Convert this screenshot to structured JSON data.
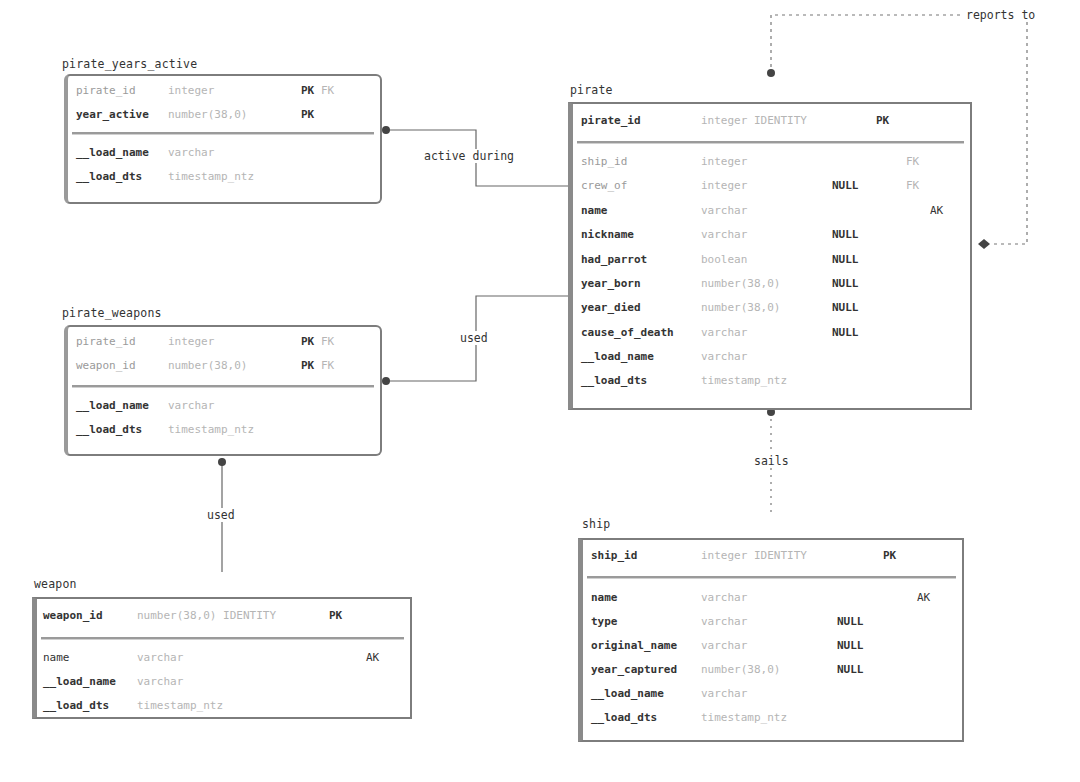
{
  "relationships": {
    "active_during": "active during",
    "used_pirate": "used",
    "used_weapon": "used",
    "reports_to": "reports to",
    "sails": "sails"
  },
  "tables": {
    "pirate_years_active": {
      "title": "pirate_years_active",
      "pk_rows": [
        {
          "name": "pirate_id",
          "type": "integer",
          "nullable": "",
          "k1": "PK",
          "k2": "FK",
          "is_fk": true
        },
        {
          "name": "year_active",
          "type": "number(38,0)",
          "nullable": "",
          "k1": "PK",
          "k2": "",
          "is_fk": false
        }
      ],
      "rows": [
        {
          "name": "__load_name",
          "type": "varchar"
        },
        {
          "name": "__load_dts",
          "type": "timestamp_ntz"
        }
      ]
    },
    "pirate_weapons": {
      "title": "pirate_weapons",
      "pk_rows": [
        {
          "name": "pirate_id",
          "type": "integer",
          "k1": "PK",
          "k2": "FK",
          "is_fk": true
        },
        {
          "name": "weapon_id",
          "type": "number(38,0)",
          "k1": "PK",
          "k2": "FK",
          "is_fk": true
        }
      ],
      "rows": [
        {
          "name": "__load_name",
          "type": "varchar"
        },
        {
          "name": "__load_dts",
          "type": "timestamp_ntz"
        }
      ]
    },
    "weapon": {
      "title": "weapon",
      "pk_rows": [
        {
          "name": "weapon_id",
          "type": "number(38,0) IDENTITY",
          "k1": "PK"
        }
      ],
      "rows": [
        {
          "name": "name",
          "type": "varchar",
          "nullable": "",
          "key": "AK"
        },
        {
          "name": "__load_name",
          "type": "varchar",
          "nullable": "",
          "key": ""
        },
        {
          "name": "__load_dts",
          "type": "timestamp_ntz",
          "nullable": "",
          "key": ""
        }
      ]
    },
    "pirate": {
      "title": "pirate",
      "pk_rows": [
        {
          "name": "pirate_id",
          "type": "integer IDENTITY",
          "k1": "PK"
        }
      ],
      "rows": [
        {
          "name": "ship_id",
          "type": "integer",
          "nullable": "",
          "fk": "FK",
          "ak": "",
          "is_fk": true
        },
        {
          "name": "crew_of",
          "type": "integer",
          "nullable": "NULL",
          "fk": "FK",
          "ak": "",
          "is_fk": true
        },
        {
          "name": "name",
          "type": "varchar",
          "nullable": "",
          "fk": "",
          "ak": "AK",
          "is_fk": false
        },
        {
          "name": "nickname",
          "type": "varchar",
          "nullable": "NULL",
          "fk": "",
          "ak": "",
          "is_fk": false
        },
        {
          "name": "had_parrot",
          "type": "boolean",
          "nullable": "NULL",
          "fk": "",
          "ak": "",
          "is_fk": false
        },
        {
          "name": "year_born",
          "type": "number(38,0)",
          "nullable": "NULL",
          "fk": "",
          "ak": "",
          "is_fk": false
        },
        {
          "name": "year_died",
          "type": "number(38,0)",
          "nullable": "NULL",
          "fk": "",
          "ak": "",
          "is_fk": false
        },
        {
          "name": "cause_of_death",
          "type": "varchar",
          "nullable": "NULL",
          "fk": "",
          "ak": "",
          "is_fk": false
        },
        {
          "name": "__load_name",
          "type": "varchar",
          "nullable": "",
          "fk": "",
          "ak": "",
          "is_fk": false
        },
        {
          "name": "__load_dts",
          "type": "timestamp_ntz",
          "nullable": "",
          "fk": "",
          "ak": "",
          "is_fk": false
        }
      ]
    },
    "ship": {
      "title": "ship",
      "pk_rows": [
        {
          "name": "ship_id",
          "type": "integer IDENTITY",
          "k1": "PK"
        }
      ],
      "rows": [
        {
          "name": "name",
          "type": "varchar",
          "nullable": "",
          "ak": "AK"
        },
        {
          "name": "type",
          "type": "varchar",
          "nullable": "NULL",
          "ak": ""
        },
        {
          "name": "original_name",
          "type": "varchar",
          "nullable": "NULL",
          "ak": ""
        },
        {
          "name": "year_captured",
          "type": "number(38,0)",
          "nullable": "NULL",
          "ak": ""
        },
        {
          "name": "__load_name",
          "type": "varchar",
          "nullable": "",
          "ak": ""
        },
        {
          "name": "__load_dts",
          "type": "timestamp_ntz",
          "nullable": "",
          "ak": ""
        }
      ]
    }
  },
  "colors": {
    "border": "#7d7d7d",
    "text": "#333333",
    "muted": "#b5b5b5",
    "line": "#555555"
  }
}
